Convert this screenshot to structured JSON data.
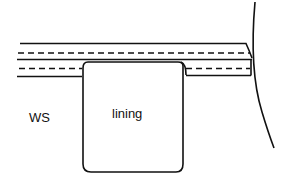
{
  "diagram": {
    "labels": {
      "wrong_side": "WS",
      "lining": "lining"
    },
    "colors": {
      "line": "#111111",
      "background": "#ffffff"
    }
  }
}
